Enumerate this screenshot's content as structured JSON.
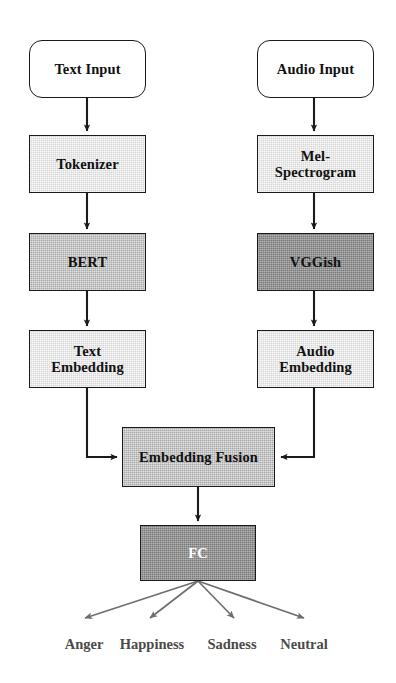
{
  "figure": {
    "type": "flowchart",
    "orientation": "top-to-bottom",
    "background_color": "#ffffff",
    "branches": [
      "text",
      "audio"
    ]
  },
  "nodes": {
    "text_input": {
      "label": "Text Input",
      "shape": "rounded-rect",
      "fill": "#ffffff",
      "text_color": "#111111"
    },
    "tokenizer": {
      "label": "Tokenizer",
      "shape": "rect",
      "fill": "#d6d6d6",
      "text_color": "#111111"
    },
    "bert": {
      "label": "BERT",
      "shape": "rect",
      "fill": "#a8a8a8",
      "text_color": "#111111"
    },
    "text_embedding": {
      "label": "Text\nEmbedding",
      "shape": "rect",
      "fill": "#d6d6d6",
      "text_color": "#111111"
    },
    "audio_input": {
      "label": "Audio Input",
      "shape": "rounded-rect",
      "fill": "#ffffff",
      "text_color": "#111111"
    },
    "mel_spectrogram": {
      "label": "Mel-\nSpectrogram",
      "shape": "rect",
      "fill": "#d6d6d6",
      "text_color": "#111111"
    },
    "vggish": {
      "label": "VGGish",
      "shape": "rect",
      "fill": "#787878",
      "text_color": "#111111"
    },
    "audio_embedding": {
      "label": "Audio\nEmbedding",
      "shape": "rect",
      "fill": "#d6d6d6",
      "text_color": "#111111"
    },
    "embedding_fusion": {
      "label": "Embedding Fusion",
      "shape": "rect",
      "fill": "#a8a8a8",
      "text_color": "#111111"
    },
    "fc": {
      "label": "FC",
      "shape": "rect",
      "fill": "#787878",
      "text_color": "#ffffff"
    }
  },
  "outputs": {
    "arrow_color": "#6e6e6e",
    "labels": [
      {
        "text": "Anger"
      },
      {
        "text": "Happiness"
      },
      {
        "text": "Sadness"
      },
      {
        "text": "Neutral"
      }
    ]
  },
  "edges": [
    {
      "from": "text_input",
      "to": "tokenizer",
      "style": "solid-arrow"
    },
    {
      "from": "tokenizer",
      "to": "bert",
      "style": "solid-arrow"
    },
    {
      "from": "bert",
      "to": "text_embedding",
      "style": "solid-arrow"
    },
    {
      "from": "text_embedding",
      "to": "embedding_fusion",
      "style": "elbow-arrow"
    },
    {
      "from": "audio_input",
      "to": "mel_spectrogram",
      "style": "solid-arrow"
    },
    {
      "from": "mel_spectrogram",
      "to": "vggish",
      "style": "solid-arrow"
    },
    {
      "from": "vggish",
      "to": "audio_embedding",
      "style": "solid-arrow"
    },
    {
      "from": "audio_embedding",
      "to": "embedding_fusion",
      "style": "elbow-arrow"
    },
    {
      "from": "embedding_fusion",
      "to": "fc",
      "style": "solid-arrow"
    },
    {
      "from": "fc",
      "to": "Anger",
      "style": "fan-arrow"
    },
    {
      "from": "fc",
      "to": "Happiness",
      "style": "fan-arrow"
    },
    {
      "from": "fc",
      "to": "Sadness",
      "style": "fan-arrow"
    },
    {
      "from": "fc",
      "to": "Neutral",
      "style": "fan-arrow"
    }
  ]
}
